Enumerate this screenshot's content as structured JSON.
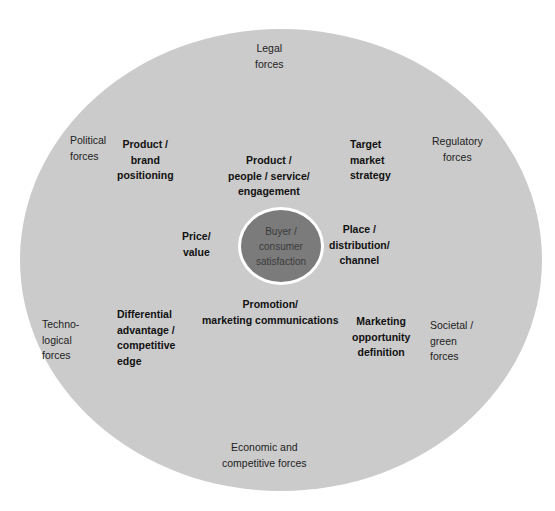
{
  "diagram": {
    "type": "concentric-ellipse",
    "colors": {
      "outer_fill": "#cbcbcb",
      "core_fill": "#7b7b7b",
      "core_border": "#ffffff"
    },
    "core": {
      "label": "Buyer /\nconsumer\nsatisfaction"
    },
    "marketing_mix": {
      "product_brand": "Product /\nbrand\npositioning",
      "product_people": "Product /\npeople / service/\nengagement",
      "target_market": "Target\n  market\n    strategy",
      "price": "Price/\nvalue",
      "place": "Place /\ndistribution/\nchannel",
      "differential": "Differential\n  advantage /\n      competitive\n          edge",
      "promotion": "Promotion/\nmarketing communications",
      "opportunity": "Marketing\nopportunity\ndefinition"
    },
    "forces": {
      "legal": "Legal\nforces",
      "political": "Political\nforces",
      "regulatory": "Regulatory\nforces",
      "technological": "Techno-\n   logical\n        forces",
      "societal": "    Societal /\n  green\nforces",
      "economic": "Economic and\ncompetitive forces"
    }
  }
}
